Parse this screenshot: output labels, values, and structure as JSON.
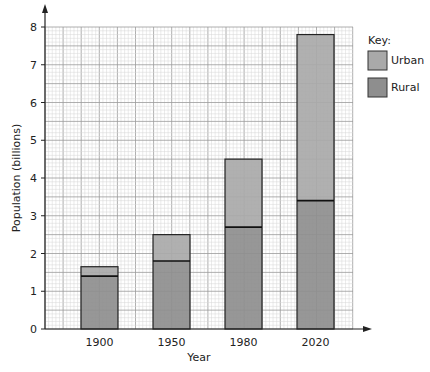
{
  "chart_data": {
    "type": "bar",
    "stacked": true,
    "title": "",
    "xlabel": "Year",
    "ylabel": "Population (billions)",
    "categories": [
      "1900",
      "1950",
      "1980",
      "2020"
    ],
    "series": [
      {
        "name": "Rural",
        "values": [
          1.4,
          1.8,
          2.7,
          3.4
        ],
        "color": "#8e8e8e"
      },
      {
        "name": "Urban",
        "values": [
          0.25,
          0.7,
          1.8,
          4.4
        ],
        "color": "#a9a9a9"
      }
    ],
    "totals": [
      1.65,
      2.5,
      4.5,
      7.8
    ],
    "ylim": [
      0,
      8
    ],
    "yticks": [
      "0",
      "1",
      "2",
      "3",
      "4",
      "5",
      "6",
      "7",
      "8"
    ],
    "grid": true,
    "legend": {
      "title": "Key:",
      "position": "right",
      "entries": [
        {
          "label": "Urban",
          "color": "#a9a9a9"
        },
        {
          "label": "Rural",
          "color": "#8e8e8e"
        }
      ]
    }
  }
}
